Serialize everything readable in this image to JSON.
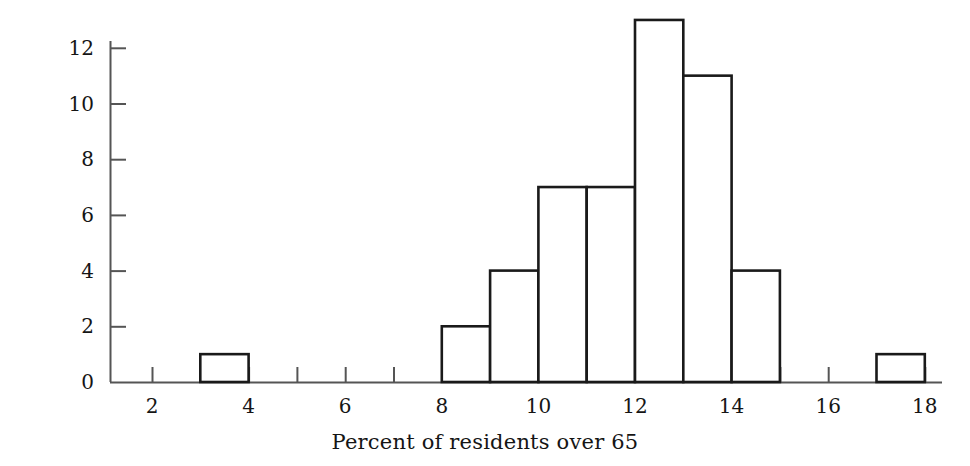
{
  "chart_data": {
    "type": "bar",
    "title": "",
    "subtitle": "",
    "xlabel": "Percent of residents over 65",
    "ylabel": "Number of states",
    "grid": false,
    "legend": false,
    "legend_position": "none",
    "xlim": [
      1,
      18
    ],
    "ylim": [
      0,
      12
    ],
    "y_axis_top_value": 12,
    "xticks": [
      2,
      3,
      4,
      5,
      6,
      7,
      8,
      9,
      10,
      11,
      12,
      13,
      14,
      15,
      16,
      17,
      18
    ],
    "xtick_labels_shown": [
      "2",
      "4",
      "6",
      "8",
      "10",
      "12",
      "14",
      "16",
      "18"
    ],
    "yticks": [
      0,
      2,
      4,
      6,
      8,
      10,
      12
    ],
    "ytick_labels": [
      "0",
      "2",
      "4",
      "6",
      "8",
      "10",
      "12"
    ],
    "bin_width": 1,
    "bins": [
      {
        "start": 3,
        "end": 4,
        "count": 1
      },
      {
        "start": 8,
        "end": 9,
        "count": 2
      },
      {
        "start": 9,
        "end": 10,
        "count": 4
      },
      {
        "start": 10,
        "end": 11,
        "count": 7
      },
      {
        "start": 11,
        "end": 12,
        "count": 7
      },
      {
        "start": 12,
        "end": 13,
        "count": 13
      },
      {
        "start": 13,
        "end": 14,
        "count": 11
      },
      {
        "start": 14,
        "end": 15,
        "count": 4
      },
      {
        "start": 17,
        "end": 18,
        "count": 1
      }
    ],
    "categories": [
      "3-4",
      "8-9",
      "9-10",
      "10-11",
      "11-12",
      "12-13",
      "13-14",
      "14-15",
      "17-18"
    ],
    "values": [
      1,
      2,
      4,
      7,
      7,
      13,
      11,
      4,
      1
    ],
    "colors": {
      "bar_fill": "#ffffff",
      "bar_stroke": "#1a1a1a",
      "axis": "#555555",
      "text": "#151515"
    }
  }
}
